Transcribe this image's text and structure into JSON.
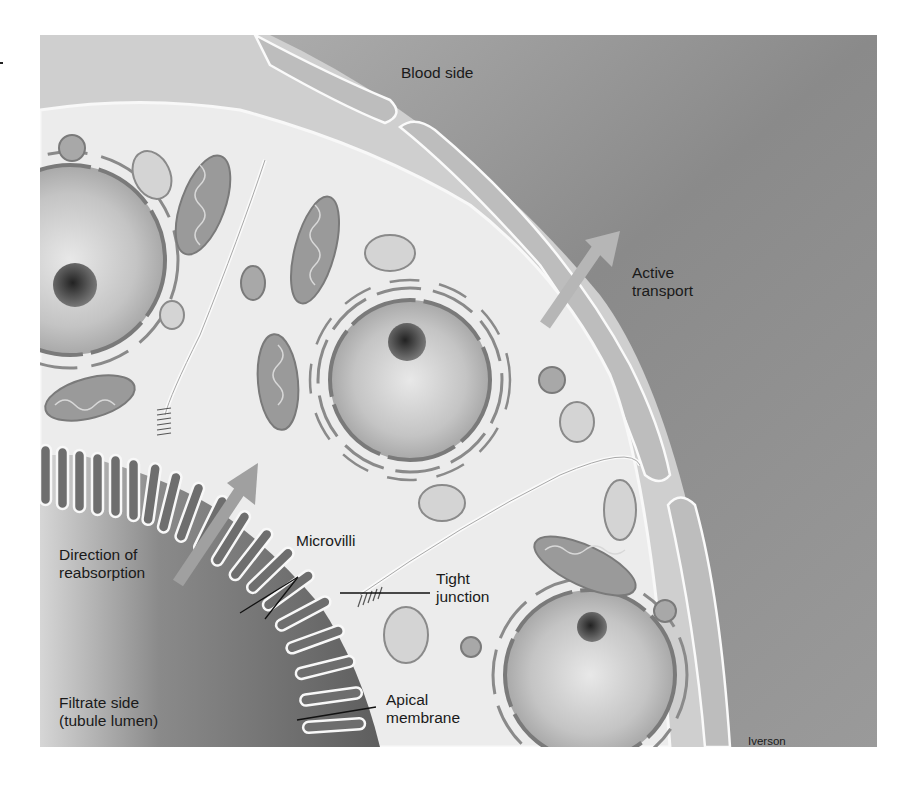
{
  "figure": {
    "labels": {
      "blood_side": "Blood side",
      "active_transport": [
        "Active",
        "transport"
      ],
      "direction_of_reabsorption": [
        "Direction of",
        "reabsorption"
      ],
      "microvilli": "Microvilli",
      "tight_junction": [
        "Tight",
        "junction"
      ],
      "filtrate_side": [
        "Filtrate side",
        "(tubule lumen)"
      ],
      "apical_membrane": [
        "Apical",
        "membrane"
      ],
      "artist_credit": "Iverson"
    },
    "colors": {
      "background_white": "#ffffff",
      "blood_side_gray": "#8e8e8e",
      "cytoplasm": "#ececec",
      "lumen_gray": "#6e6e6e",
      "membrane_highlight": "#fafafa",
      "organelle": "#9a9a9a",
      "nucleus": "#c8c8c8",
      "text": "#1a1a1a"
    }
  }
}
